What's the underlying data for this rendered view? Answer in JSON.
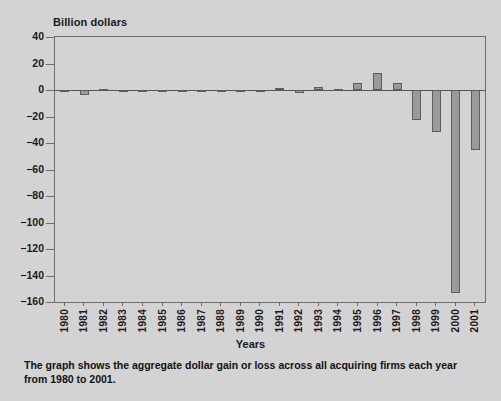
{
  "chart_data": {
    "type": "bar",
    "title": "",
    "ylabel": "Billion dollars",
    "xlabel": "Years",
    "ylim": [
      -160,
      40
    ],
    "ytick_step": 20,
    "yticks": [
      40,
      20,
      0,
      -20,
      -40,
      -60,
      -80,
      -100,
      -120,
      -140,
      -160
    ],
    "ytick_labels": [
      "40",
      "20",
      "0",
      "−20",
      "−40",
      "−60",
      "−80",
      "−100",
      "−120",
      "−140",
      "−160"
    ],
    "grid": false,
    "legend": null,
    "categories": [
      "1980",
      "1981",
      "1982",
      "1983",
      "1984",
      "1985",
      "1986",
      "1987",
      "1988",
      "1989",
      "1990",
      "1991",
      "1992",
      "1993",
      "1994",
      "1995",
      "1996",
      "1997",
      "1998",
      "1999",
      "2000",
      "2001"
    ],
    "values": [
      -1.5,
      -3.5,
      0.5,
      0.3,
      -0.5,
      -0.4,
      -0.6,
      -0.5,
      -1.5,
      -1.2,
      -1.5,
      1.5,
      -2.0,
      2.0,
      1.0,
      5.5,
      13.0,
      5.0,
      -23.0,
      -32.0,
      -153.0,
      -45.0
    ],
    "bar_color": "#9a9a9a",
    "bar_edge_color": "#5d5d5d",
    "background_color": "#d3d3d3"
  },
  "caption": {
    "text": "The graph shows the aggregate dollar gain or loss across all acquiring firms each year from 1980 to 2001."
  }
}
